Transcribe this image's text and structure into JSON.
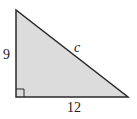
{
  "diagram": {
    "type": "right-triangle",
    "fill_color": "#dcdcdc",
    "stroke_color": "#2a2a2a",
    "vertices": {
      "top": [
        16,
        10
      ],
      "right_angle": [
        16,
        97
      ],
      "right": [
        128,
        97
      ]
    },
    "labels": {
      "vertical_leg": "9",
      "horizontal_leg": "12",
      "hypotenuse": "c"
    },
    "right_angle_marker": true
  }
}
